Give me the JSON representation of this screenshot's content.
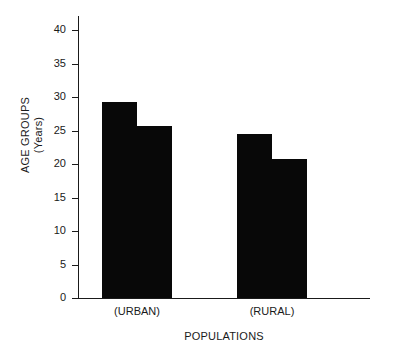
{
  "chart_data": {
    "type": "bar",
    "title": "",
    "subtitle": "",
    "xlabel": "POPULATIONS",
    "ylabel_line1": "AGE GROUPS",
    "ylabel_line2": "(Years)",
    "ylabel": "AGE GROUPS (Years)",
    "categories": [
      "(URBAN)",
      "(RURAL)"
    ],
    "series": [
      {
        "name": "series-1",
        "values": [
          29.3,
          24.5
        ]
      },
      {
        "name": "series-2",
        "values": [
          25.7,
          20.8
        ]
      }
    ],
    "ylim": [
      0,
      40
    ],
    "ytick_values": [
      0,
      5,
      10,
      15,
      20,
      25,
      30,
      35,
      40
    ],
    "ytick_labels": [
      "0",
      "5",
      "10",
      "15",
      "20",
      "25",
      "30",
      "35",
      "40"
    ],
    "xlim_categories": 2,
    "grid": false,
    "legend": "none",
    "bar_color": "#080808",
    "axis_color": "#1a1a1a",
    "background_color": "#ffffff",
    "annotations": []
  }
}
